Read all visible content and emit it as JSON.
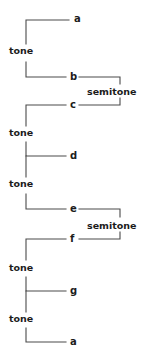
{
  "diagram": {
    "type": "music-scale-interval-bracket-diagram",
    "line_color": "#4a4a4a",
    "text_color": "#1c1c1c",
    "background_color": "#ffffff",
    "notes": [
      {
        "id": "note-a-top",
        "label": "a",
        "x": 74,
        "y": 22
      },
      {
        "id": "note-b",
        "label": "b",
        "x": 70,
        "y": 80
      },
      {
        "id": "note-c",
        "label": "c",
        "x": 70,
        "y": 108
      },
      {
        "id": "note-d",
        "label": "d",
        "x": 70,
        "y": 159
      },
      {
        "id": "note-e",
        "label": "e",
        "x": 70,
        "y": 212
      },
      {
        "id": "note-f",
        "label": "f",
        "x": 70,
        "y": 242
      },
      {
        "id": "note-g",
        "label": "g",
        "x": 70,
        "y": 294
      },
      {
        "id": "note-a-bottom",
        "label": "a",
        "x": 70,
        "y": 345
      }
    ],
    "intervals": [
      {
        "id": "interval-tone-a-b",
        "label": "tone",
        "x": 9,
        "y": 54
      },
      {
        "id": "interval-semitone-b-c",
        "label": "semitone",
        "x": 87,
        "y": 95
      },
      {
        "id": "interval-tone-c-d",
        "label": "tone",
        "x": 9,
        "y": 136
      },
      {
        "id": "interval-tone-d-e",
        "label": "tone",
        "x": 9,
        "y": 187
      },
      {
        "id": "interval-semitone-e-f",
        "label": "semitone",
        "x": 87,
        "y": 229
      },
      {
        "id": "interval-tone-f-g",
        "label": "tone",
        "x": 9,
        "y": 271
      },
      {
        "id": "interval-tone-g-a",
        "label": "tone",
        "x": 9,
        "y": 322
      }
    ],
    "brackets": [
      {
        "id": "bracket-tone-a-b",
        "d": "M 69 20 L 26 20 L 26 44"
      },
      {
        "id": "bracket-tone-a-b-low",
        "d": "M 26 62 L 26 77 L 66 77"
      },
      {
        "id": "bracket-semitone-b-c",
        "d": "M 79 77 L 120 77 L 120 84"
      },
      {
        "id": "bracket-semitone-b-c-low",
        "d": "M 120 98 L 120 105 L 79 105"
      },
      {
        "id": "bracket-tone-c-d",
        "d": "M 66 105 L 26 105 L 26 126"
      },
      {
        "id": "bracket-tone-c-d-low",
        "d": "M 26 142 L 26 156 L 66 156"
      },
      {
        "id": "bracket-tone-d-e",
        "d": "M 26 156 L 26 177"
      },
      {
        "id": "bracket-tone-d-e-low",
        "d": "M 26 194 L 26 209 L 66 209"
      },
      {
        "id": "bracket-semitone-e-f",
        "d": "M 79 209 L 120 209 L 120 217"
      },
      {
        "id": "bracket-semitone-e-f-low",
        "d": "M 120 232 L 120 239 L 79 239"
      },
      {
        "id": "bracket-tone-f-g",
        "d": "M 66 239 L 26 239 L 26 260"
      },
      {
        "id": "bracket-tone-f-g-low",
        "d": "M 26 277 L 26 291 L 66 291"
      },
      {
        "id": "bracket-tone-g-a",
        "d": "M 26 291 L 26 312"
      },
      {
        "id": "bracket-tone-g-a-low",
        "d": "M 26 328 L 26 342 L 66 342"
      }
    ]
  }
}
